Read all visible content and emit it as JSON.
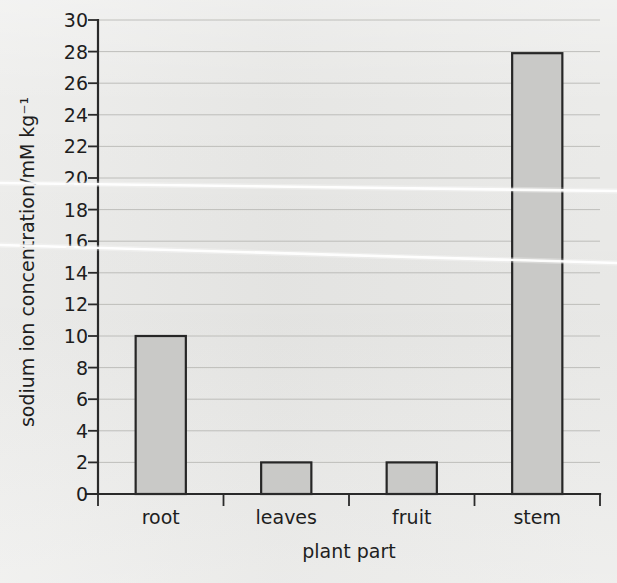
{
  "chart_data": {
    "type": "bar",
    "title": "",
    "subtitle": "",
    "categories": [
      "root",
      "leaves",
      "fruit",
      "stem"
    ],
    "values": [
      10,
      2,
      2,
      27.9
    ],
    "xlabel": "plant part",
    "ylabel": "sodium ion concentration/mM kg⁻¹",
    "ylim": [
      0,
      30
    ],
    "ytick_step": 2,
    "yticks": [
      0,
      2,
      4,
      6,
      8,
      10,
      12,
      14,
      16,
      18,
      20,
      22,
      24,
      26,
      28,
      30
    ],
    "ytick_labels": [
      "0",
      "2",
      "4",
      "6",
      "8",
      "10",
      "12",
      "14",
      "16",
      "18",
      "20",
      "22",
      "24",
      "26",
      "28",
      "30"
    ],
    "grid": true,
    "grid_axis": "y",
    "legend": false,
    "legend_position": "none",
    "annotations": []
  },
  "style": {
    "page_background": "#e9e9e7",
    "bar_fill": "#c9c9c7",
    "bar_stroke": "#262626",
    "axis_color": "#2a2a2a",
    "grid_color": "#b9b9b6",
    "text_color": "#1e1e1e",
    "scan_artifact_color": "#ffffff"
  }
}
